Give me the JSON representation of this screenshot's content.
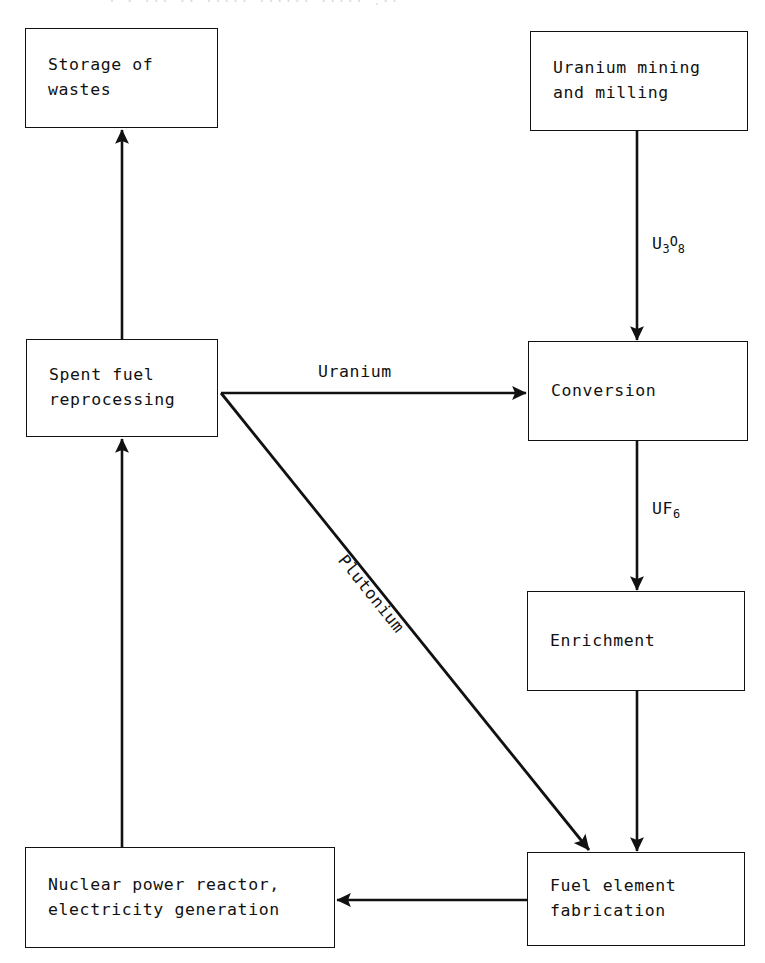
{
  "diagram": {
    "type": "flowchart",
    "title_remnant": "· · ··· ·· ····· ······ ····· ,··",
    "background_color": "#ffffff",
    "line_color": "#111111",
    "nodes": [
      {
        "id": "storage",
        "label": "Storage of\nwastes"
      },
      {
        "id": "mining",
        "label": "Uranium mining\nand milling"
      },
      {
        "id": "reprocess",
        "label": "Spent fuel\nreprocessing"
      },
      {
        "id": "conversion",
        "label": "Conversion"
      },
      {
        "id": "enrichment",
        "label": "Enrichment"
      },
      {
        "id": "reactor",
        "label": "Nuclear power reactor,\nelectricity generation"
      },
      {
        "id": "fabrication",
        "label": "Fuel element\nfabrication"
      }
    ],
    "edges": [
      {
        "id": "mining-to-conversion",
        "from": "mining",
        "to": "conversion",
        "label_main": "U",
        "label_sub1": "3",
        "label_sup": "O",
        "label_sub2": "8"
      },
      {
        "id": "conversion-to-enrichment",
        "from": "conversion",
        "to": "enrichment",
        "label_main": "UF",
        "label_sub1": "6"
      },
      {
        "id": "enrichment-to-fabrication",
        "from": "enrichment",
        "to": "fabrication",
        "label_main": ""
      },
      {
        "id": "fabrication-to-reactor",
        "from": "fabrication",
        "to": "reactor",
        "label_main": ""
      },
      {
        "id": "reactor-to-reprocess",
        "from": "reactor",
        "to": "reprocess",
        "label_main": ""
      },
      {
        "id": "reprocess-to-storage",
        "from": "reprocess",
        "to": "storage",
        "label_main": ""
      },
      {
        "id": "reprocess-to-conversion",
        "from": "reprocess",
        "to": "conversion",
        "label_main": "Uranium"
      },
      {
        "id": "reprocess-to-fabrication",
        "from": "reprocess",
        "to": "fabrication",
        "label_main": "Plutonium"
      }
    ]
  }
}
